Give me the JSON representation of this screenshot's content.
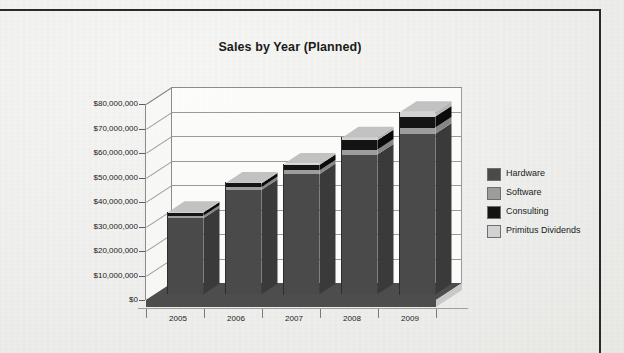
{
  "document": {
    "border_color": "#2a2a2a",
    "page_background": "#f0f0ee"
  },
  "chart_data": {
    "type": "bar",
    "subtype": "stacked-column-3d",
    "title": "Sales by Year (Planned)",
    "xlabel": "",
    "ylabel": "",
    "categories": [
      "2005",
      "2006",
      "2007",
      "2008",
      "2009"
    ],
    "ylim": [
      0,
      80000000
    ],
    "ytick_labels": [
      "$80,000,000",
      "$70,000,000",
      "$60,000,000",
      "$50,000,000",
      "$40,000,000",
      "$30,000,000",
      "$20,000,000",
      "$10,000,000",
      "$0"
    ],
    "ytick_values": [
      80000000,
      70000000,
      60000000,
      50000000,
      40000000,
      30000000,
      20000000,
      10000000,
      0
    ],
    "grid": true,
    "legend_position": "right",
    "series": [
      {
        "name": "Hardware",
        "color": "#4a4a4a",
        "values": [
          31000000,
          42500000,
          49000000,
          57000000,
          65500000
        ]
      },
      {
        "name": "Software",
        "color": "#9d9d9d",
        "values": [
          1000000,
          1200000,
          1500000,
          2000000,
          2500000
        ]
      },
      {
        "name": "Consulting",
        "color": "#141414",
        "values": [
          1300000,
          1500000,
          2200000,
          3800000,
          4500000
        ]
      },
      {
        "name": "Primitus Dividends",
        "color": "#d2d2d2",
        "values": [
          300000,
          400000,
          600000,
          1200000,
          2000000
        ]
      }
    ],
    "totals": [
      33600000,
      45600000,
      53300000,
      64000000,
      74500000
    ]
  },
  "legend": {
    "items": [
      {
        "label": "Hardware",
        "swatch": "#4a4a4a"
      },
      {
        "label": "Software",
        "swatch": "#9d9d9d"
      },
      {
        "label": "Consulting",
        "swatch": "#141414"
      },
      {
        "label": "Primitus Dividends",
        "swatch": "#d2d2d2"
      }
    ]
  }
}
